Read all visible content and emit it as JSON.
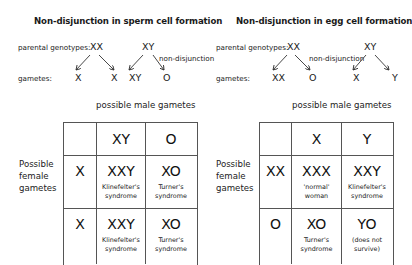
{
  "left": {
    "title": "Non-disjunction in sperm cell formation",
    "parental_label": "parental genotypes:",
    "gametes_label": "gametes:",
    "mother_genotype": "XX",
    "father_genotype": "XY",
    "nondisjunction_label": "non-disjunction",
    "gametes": [
      "X",
      "X",
      "XY",
      "O"
    ],
    "table_caption": "possible male gametes",
    "side_label": [
      "Possible",
      "female",
      "gametes"
    ],
    "col_headers": [
      "XY",
      "O"
    ],
    "rows": [
      {
        "header": "X",
        "cells": [
          {
            "genotype": "XXY",
            "note": [
              "Klinefelter's",
              "syndrome"
            ]
          },
          {
            "genotype": "XO",
            "note": [
              "Turner's",
              "syndrome"
            ]
          }
        ]
      },
      {
        "header": "X",
        "cells": [
          {
            "genotype": "XXY",
            "note": [
              "Klinefelter's",
              "syndrome"
            ]
          },
          {
            "genotype": "XO",
            "note": [
              "Turner's",
              "syndrome"
            ]
          }
        ]
      }
    ]
  },
  "right": {
    "title": "Non-disjunction in egg cell formation",
    "parental_label": "parental genotypes:",
    "gametes_label": "gametes:",
    "mother_genotype": "XX",
    "father_genotype": "XY",
    "nondisjunction_label": "non-disjunction",
    "gametes": [
      "XX",
      "O",
      "X",
      "Y"
    ],
    "table_caption": "possible male gametes",
    "side_label": [
      "Possible",
      "female",
      "gametes"
    ],
    "col_headers": [
      "X",
      "Y"
    ],
    "rows": [
      {
        "header": "XX",
        "cells": [
          {
            "genotype": "XXX",
            "note": [
              "'normal'",
              "woman"
            ]
          },
          {
            "genotype": "XXY",
            "note": [
              "Klinefelter's",
              "syndrome"
            ]
          }
        ]
      },
      {
        "header": "O",
        "cells": [
          {
            "genotype": "XO",
            "note": [
              "Turner's",
              "syndrome"
            ]
          },
          {
            "genotype": "YO",
            "note": [
              "(does not",
              "survive)"
            ]
          }
        ]
      }
    ]
  }
}
